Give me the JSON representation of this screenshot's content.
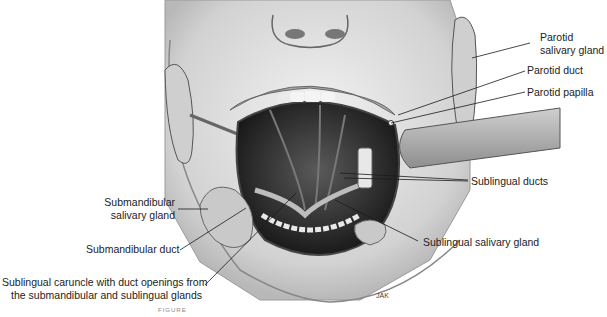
{
  "figure": {
    "artist_signature": "JAK",
    "caption_visible_fragment": "FIGURE"
  },
  "labels": {
    "parotid_gland": {
      "line1": "Parotid",
      "line2": "salivary gland"
    },
    "parotid_duct": "Parotid duct",
    "parotid_papilla": "Parotid papilla",
    "sublingual_ducts": "Sublingual ducts",
    "submandibular_gland": {
      "line1": "Submandibular",
      "line2": "salivary gland"
    },
    "submandibular_duct": "Submandibular duct",
    "sublingual_gland": "Sublingual salivary gland",
    "sublingual_caruncle": {
      "line1": "Sublingual caruncle with duct openings from",
      "line2": "the submandibular and sublingual glands"
    }
  },
  "colors": {
    "line": "#1a1a1a",
    "skin": "#d9d9d9",
    "mouth": "#2b2b2b",
    "teeth": "#f4f4f4",
    "gland": "#c9c9c9"
  }
}
